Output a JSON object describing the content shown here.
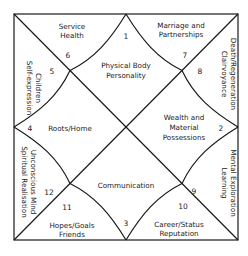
{
  "chart": {
    "title": "",
    "style": {
      "line_color": "#1a1a1a",
      "background": "#ffffff",
      "text_color": "#222222"
    },
    "houses": [
      {
        "number": "1",
        "lines": [
          "Physical Body",
          "Personality"
        ]
      },
      {
        "number": "2",
        "lines": [
          "Wealth and",
          "Material",
          "Possessions"
        ]
      },
      {
        "number": "3",
        "lines": [
          "Communication"
        ]
      },
      {
        "number": "4",
        "lines": [
          "Roots/Home"
        ]
      },
      {
        "number": "5",
        "lines": [
          "Children",
          "Self-expression"
        ]
      },
      {
        "number": "6",
        "lines": [
          "Service",
          "Health"
        ]
      },
      {
        "number": "7",
        "lines": [
          "Marriage and",
          "Partnerships"
        ]
      },
      {
        "number": "8",
        "lines": [
          "Death/Regeneration",
          "Clairvoyance"
        ]
      },
      {
        "number": "9",
        "lines": [
          "Mental Exploration",
          "Learning"
        ]
      },
      {
        "number": "10",
        "lines": [
          "Career/Status",
          "Reputation"
        ]
      },
      {
        "number": "11",
        "lines": [
          "Hopes/Goals",
          "Friends"
        ]
      },
      {
        "number": "12",
        "lines": [
          "Unconscious Mind",
          "Spiritual Realisation"
        ]
      }
    ]
  }
}
